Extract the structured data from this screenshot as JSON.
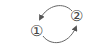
{
  "diagram": {
    "type": "cycle",
    "nodes": [
      {
        "id": "1",
        "label": "①"
      },
      {
        "id": "2",
        "label": "②"
      }
    ],
    "edges": [
      {
        "from": "2",
        "to": "1",
        "path": "top-arc"
      },
      {
        "from": "1",
        "to": "2",
        "path": "bottom-arc"
      }
    ],
    "stroke_color": "#555555"
  }
}
